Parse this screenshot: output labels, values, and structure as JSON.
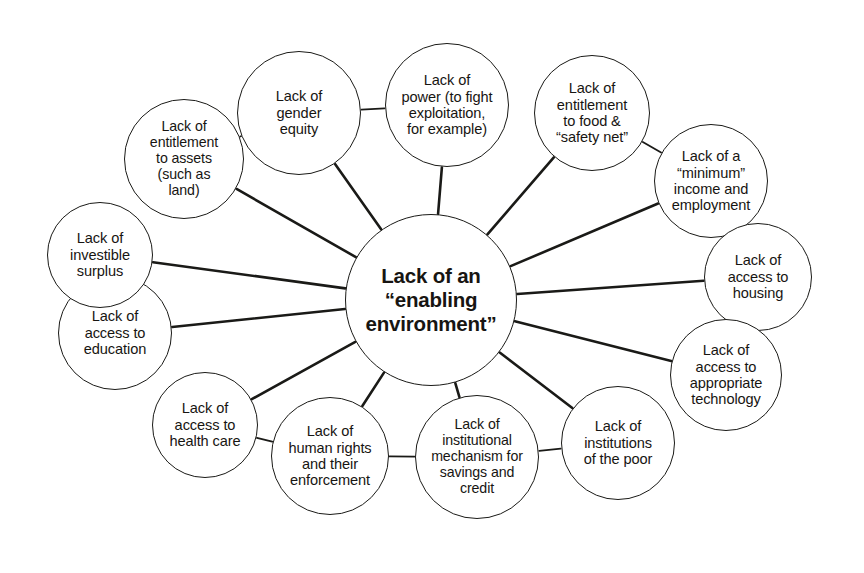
{
  "diagram": {
    "type": "hub-and-spoke concept map",
    "background_color": "#ffffff",
    "stroke_color": "#1a1a17",
    "text_color": "#171512",
    "center": {
      "id": "enabling-environment",
      "label": "Lack of an\n“enabling\nenvironment”",
      "cx": 431,
      "cy": 300,
      "r": 86
    },
    "nodes": [
      {
        "id": "gender-equity",
        "label": "Lack of\ngender\nequity",
        "cx": 299,
        "cy": 113,
        "r": 62
      },
      {
        "id": "power",
        "label": "Lack of\npower (to fight\nexploitation,\nfor example)",
        "cx": 447,
        "cy": 105,
        "r": 62
      },
      {
        "id": "food-safety-net",
        "label": "Lack of\nentitlement\nto food &\n“safety net”",
        "cx": 592,
        "cy": 113,
        "r": 58
      },
      {
        "id": "minimum-income",
        "label": "Lack of a\n“minimum”\nincome and\nemployment",
        "cx": 711,
        "cy": 181,
        "r": 57
      },
      {
        "id": "housing",
        "label": "Lack of\naccess to\nhousing",
        "cx": 758,
        "cy": 277,
        "r": 54
      },
      {
        "id": "appropriate-technology",
        "label": "Lack of\naccess to\nappropriate\ntechnology",
        "cx": 726,
        "cy": 375,
        "r": 56
      },
      {
        "id": "institutions-of-the-poor",
        "label": "Lack of\ninstitutions\nof the poor",
        "cx": 618,
        "cy": 443,
        "r": 57
      },
      {
        "id": "savings-and-credit",
        "label": "Lack of\ninstitutional\nmechanism for\nsavings and\ncredit",
        "cx": 477,
        "cy": 457,
        "r": 62
      },
      {
        "id": "human-rights",
        "label": "Lack of\nhuman rights\nand their\nenforcement",
        "cx": 330,
        "cy": 456,
        "r": 59
      },
      {
        "id": "health-care",
        "label": "Lack of\naccess to\nhealth care",
        "cx": 205,
        "cy": 425,
        "r": 53
      },
      {
        "id": "education",
        "label": "Lack of\naccess to\neducation",
        "cx": 115,
        "cy": 333,
        "r": 57
      },
      {
        "id": "investible-surplus",
        "label": "Lack of\ninvestible\nsurplus",
        "cx": 100,
        "cy": 255,
        "r": 53
      },
      {
        "id": "entitlement-to-assets",
        "label": "Lack of\nentitlement\nto assets\n(such as\nland)",
        "cx": 184,
        "cy": 159,
        "r": 60
      }
    ],
    "edges": [
      {
        "from": "enabling-environment",
        "to": "gender-equity"
      },
      {
        "from": "enabling-environment",
        "to": "power"
      },
      {
        "from": "enabling-environment",
        "to": "food-safety-net"
      },
      {
        "from": "enabling-environment",
        "to": "minimum-income"
      },
      {
        "from": "enabling-environment",
        "to": "housing"
      },
      {
        "from": "enabling-environment",
        "to": "appropriate-technology"
      },
      {
        "from": "enabling-environment",
        "to": "institutions-of-the-poor"
      },
      {
        "from": "enabling-environment",
        "to": "savings-and-credit"
      },
      {
        "from": "enabling-environment",
        "to": "human-rights"
      },
      {
        "from": "enabling-environment",
        "to": "health-care"
      },
      {
        "from": "enabling-environment",
        "to": "education"
      },
      {
        "from": "enabling-environment",
        "to": "investible-surplus"
      },
      {
        "from": "enabling-environment",
        "to": "entitlement-to-assets"
      },
      {
        "from": "gender-equity",
        "to": "power"
      },
      {
        "from": "gender-equity",
        "to": "entitlement-to-assets"
      },
      {
        "from": "food-safety-net",
        "to": "minimum-income"
      },
      {
        "from": "savings-and-credit",
        "to": "human-rights"
      },
      {
        "from": "savings-and-credit",
        "to": "institutions-of-the-poor"
      },
      {
        "from": "health-care",
        "to": "human-rights"
      }
    ]
  }
}
